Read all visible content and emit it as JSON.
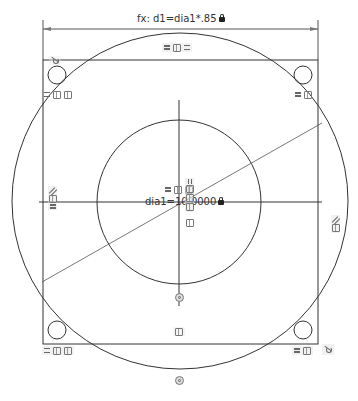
{
  "sketch": {
    "dimensions": {
      "horizontal_equation": "fx: d1=dia1*.85",
      "diameter_label": "dia1=10.0000",
      "locked": true
    },
    "geometry": {
      "rectangle": {
        "x": 43,
        "y": 60,
        "width": 275,
        "height": 284
      },
      "outer_circle": {
        "cx": 180,
        "cy": 201,
        "r": 168
      },
      "inner_circle": {
        "cx": 179,
        "cy": 202,
        "r": 82
      },
      "corner_circles": [
        {
          "cx": 57,
          "cy": 75,
          "r": 9
        },
        {
          "cx": 303,
          "cy": 75,
          "r": 9
        },
        {
          "cx": 57,
          "cy": 330,
          "r": 9
        },
        {
          "cx": 303,
          "cy": 330,
          "r": 9
        }
      ],
      "diagonal_line": {
        "x1": 42,
        "y1": 282,
        "x2": 322,
        "y2": 123
      },
      "horizontal_centerline": {
        "x1": 39,
        "x2": 322,
        "y": 202
      },
      "vertical_centerline": {
        "x": 179,
        "y1": 100,
        "y2": 306
      },
      "dimension_line": {
        "x1": 43,
        "x2": 318,
        "y": 29,
        "ext_top": 20
      }
    },
    "colors": {
      "stroke": "#333333",
      "constraint_bg": "#e6e6e6",
      "text": "#333333"
    },
    "constraint_glyphs": {
      "top_center": [
        "equal",
        "coincident",
        "equal"
      ],
      "top_left": [
        "equal",
        "coincident",
        "coincident"
      ],
      "top_right": [
        "equal",
        "coincident"
      ],
      "left_mid": [
        "parallel",
        "coincident",
        "equal"
      ],
      "right_mid": [
        "parallel",
        "coincident"
      ],
      "center": [
        "equal",
        "coincident",
        "coincident"
      ],
      "center_vertical": [
        "perpendicular",
        "coincident",
        "coincident",
        "coincident"
      ],
      "bottom_mid": [
        "coincident"
      ],
      "bottom_left": [
        "equal",
        "coincident",
        "coincident"
      ],
      "bottom_right": [
        "equal",
        "coincident",
        "tangent"
      ],
      "top_left_corner": [
        "tangent"
      ]
    }
  }
}
